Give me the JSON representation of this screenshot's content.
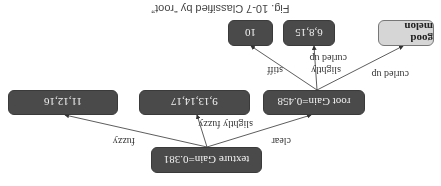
{
  "diagram": {
    "orientation_degrees": 180,
    "caption": "Fig. 10-7   Classified by “root”",
    "nodes": {
      "texture": "texture Gain=0.381",
      "root": "root Gain=0.458",
      "slightly_fuzzy_leaf": "9,13,14,17",
      "fuzzy_leaf": "11,12,16",
      "good_melon": "good melon",
      "slightly_curled_leaf": "6,8,15",
      "stiff_leaf": "10"
    },
    "edges": {
      "clear": "clear",
      "slightly_fuzzy": "slightly fuzzy",
      "fuzzy": "fuzzy",
      "curled_up": "curled up",
      "slightly_curled_up_1": "slightly",
      "slightly_curled_up_2": "curled up",
      "stiff": "stiff"
    },
    "colors": {
      "internal_node": "#4a4a4a",
      "leaf_good": "#d6d6d6",
      "edge": "#333333"
    }
  }
}
